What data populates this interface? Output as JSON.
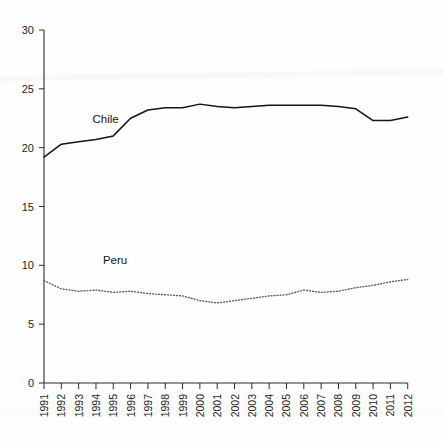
{
  "chart_data": {
    "type": "line",
    "title": "",
    "subtitle": "",
    "xlabel": "",
    "ylabel": "",
    "x": [
      1991,
      1992,
      1993,
      1994,
      1995,
      1996,
      1997,
      1998,
      1999,
      2000,
      2001,
      2002,
      2003,
      2004,
      2005,
      2006,
      2007,
      2008,
      2009,
      2010,
      2011,
      2012
    ],
    "categories": [
      "1991",
      "1992",
      "1993",
      "1994",
      "1995",
      "1996",
      "1997",
      "1998",
      "1999",
      "2000",
      "2001",
      "2002",
      "2003",
      "2004",
      "2005",
      "2006",
      "2007",
      "2008",
      "2009",
      "2010",
      "2011",
      "2012"
    ],
    "series": [
      {
        "name": "Chile",
        "style": "solid",
        "color": "#141414",
        "values": [
          19.2,
          20.3,
          20.5,
          20.7,
          21.0,
          22.5,
          23.2,
          23.4,
          23.4,
          23.7,
          23.5,
          23.4,
          23.5,
          23.6,
          23.6,
          23.6,
          23.6,
          23.5,
          23.3,
          22.3,
          22.3,
          22.6
        ],
        "label_text": "Chile",
        "label_x": 1993.8,
        "label_y": 22.1
      },
      {
        "name": "Peru",
        "style": "dotted",
        "color": "#5d5d5d",
        "values": [
          8.7,
          8.0,
          7.8,
          7.9,
          7.7,
          7.8,
          7.6,
          7.5,
          7.4,
          7.0,
          6.8,
          7.0,
          7.2,
          7.4,
          7.5,
          7.9,
          7.7,
          7.8,
          8.1,
          8.3,
          8.6,
          8.8
        ],
        "label_text": "Peru",
        "label_x": 1994.4,
        "label_y": 10.1
      }
    ],
    "ylim": [
      0,
      30
    ],
    "yticks": [
      0,
      5,
      10,
      15,
      20,
      25,
      30
    ],
    "ytick_labels": [
      "0",
      "5",
      "10",
      "15",
      "20",
      "25",
      "30"
    ],
    "xlim": [
      1991,
      2012
    ],
    "grid": false,
    "legend": "inline-series-labels",
    "legend_position": "inline"
  },
  "axes": {
    "y_axis_name": "y-axis",
    "x_axis_name": "x-axis"
  }
}
